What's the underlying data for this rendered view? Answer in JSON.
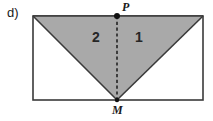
{
  "figure": {
    "part_label": "d)",
    "vertices": {
      "top_midpoint_label": "P",
      "bottom_midpoint_label": "M"
    },
    "regions": [
      {
        "label": "2",
        "side": "left"
      },
      {
        "label": "1",
        "side": "right"
      }
    ],
    "colors": {
      "shaded_fill": "#a9a9a9",
      "stroke": "#3a3a3a",
      "background": "#ffffff",
      "point_marker": "#111111",
      "dashed_line": "#1a1a1a"
    },
    "geometry": {
      "rect_left": 33,
      "rect_top": 16,
      "rect_right": 203,
      "rect_bottom": 100,
      "midpoint_x": 117,
      "triangle_points": "33,16 203,16 117,100",
      "dashed_line_x": 117,
      "dashed_line_y1": 16,
      "dashed_line_y2": 100,
      "point_marker_radius": 3
    }
  }
}
